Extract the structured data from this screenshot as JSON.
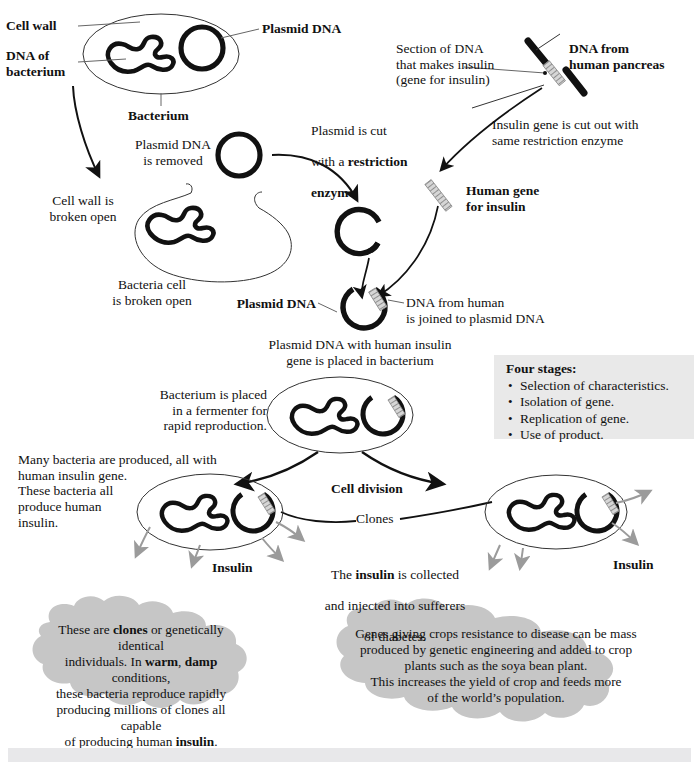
{
  "diagram": {
    "colors": {
      "ink": "#111111",
      "cell_outline": "#222222",
      "gene_grey": "#9a9a9a",
      "cloud_fill": "#c6c6c6",
      "stages_box": "#e9e9e9",
      "bottom_bar": "#e8e8ea",
      "insulin_arrow": "#9b9b9b"
    },
    "labels": {
      "cell_wall": "Cell wall",
      "dna_of_bacterium": "DNA of\nbacterium",
      "plasmid_dna_top": "Plasmid DNA",
      "bacterium": "Bacterium",
      "plasmid_removed": "Plasmid DNA\nis removed",
      "cell_wall_broken": "Cell wall is\nbroken open",
      "bacteria_cell_broken": "Bacteria cell\nis broken open",
      "plasmid_cut": "Plasmid is cut\nwith a restriction\nenzyme",
      "plasmid_cut_bold_1": "restriction",
      "plasmid_cut_bold_2": "enzyme",
      "section_of_dna": "Section of DNA\nthat makes insulin\n(gene for insulin)",
      "dna_from_pancreas": "DNA from\nhuman pancreas",
      "insulin_gene_cut": "Insulin gene is cut out with\nsame restriction enzyme",
      "human_gene_for_insulin": "Human gene\nfor insulin",
      "plasmid_dna_joined_label": "Plasmid DNA",
      "dna_joined": "DNA from human\nis joined to plasmid DNA",
      "plasmid_in_bacterium": "Plasmid DNA with human insulin\ngene is placed in bacterium",
      "bacterium_fermenter": "Bacterium is placed\nin a fermenter for\nrapid reproduction.",
      "many_bacteria": "Many bacteria are produced, all with\nhuman insulin gene.\nThese bacteria all\nproduce human\ninsulin.",
      "cell_division": "Cell division",
      "clones": "Clones",
      "insulin_left": "Insulin",
      "insulin_right": "Insulin",
      "insulin_collected": "The insulin is collected\nand injected into sufferers\nof diabetes.",
      "insulin_collected_bold": "insulin"
    },
    "stages_box": {
      "heading": "Four stages:",
      "items": [
        "Selection of characteristics.",
        "Isolation of gene.",
        "Replication of gene.",
        "Use of product."
      ]
    },
    "clouds": [
      {
        "id": "clones-cloud",
        "lines": [
          "These are clones or genetically identical",
          "individuals. In warm, damp conditions,",
          "these bacteria reproduce rapidly",
          "producing millions of clones all capable",
          "of producing human insulin."
        ],
        "bold_words": [
          "clones",
          "warm",
          "damp",
          "insulin"
        ]
      },
      {
        "id": "crops-cloud",
        "lines": [
          "Genes giving crops resistance to disease can be mass",
          "produced by genetic engineering and added to crop",
          "plants such as the soya bean plant.",
          "This increases the yield of crop and feeds more",
          "of the world’s population."
        ],
        "bold_words": []
      }
    ]
  }
}
